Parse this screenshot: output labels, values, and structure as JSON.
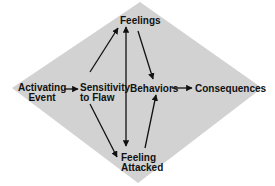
{
  "diagram": {
    "background_color": "#d2d2d2",
    "ink_color": "#111111",
    "nodes": {
      "activating_event": {
        "line1": "Activating",
        "line2": "Event"
      },
      "sensitivity": {
        "line1": "Sensitivity",
        "line2": "to Flaw"
      },
      "feelings": {
        "label": "Feelings"
      },
      "feeling_attacked": {
        "line1": "Feeling",
        "line2": "Attacked"
      },
      "behaviors": {
        "label": "Behaviors"
      },
      "consequences": {
        "label": "Consequences"
      }
    },
    "edges": [
      {
        "from": "Activating Event",
        "to": "Sensitivity to Flaw"
      },
      {
        "from": "Sensitivity to Flaw",
        "to": "Feelings"
      },
      {
        "from": "Sensitivity to Flaw",
        "to": "Feeling Attacked"
      },
      {
        "from": "Feelings",
        "to": "Feeling Attacked",
        "bidirectional": true
      },
      {
        "from": "Feelings",
        "to": "Behaviors"
      },
      {
        "from": "Feeling Attacked",
        "to": "Behaviors"
      },
      {
        "from": "Behaviors",
        "to": "Consequences"
      }
    ]
  }
}
